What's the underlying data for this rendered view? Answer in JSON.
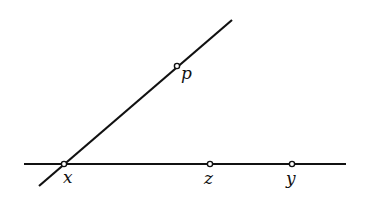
{
  "diagram": {
    "lines": [
      {
        "id": "horizontal-line",
        "x1": 24,
        "y1": 164,
        "x2": 346,
        "y2": 164
      },
      {
        "id": "slanted-line",
        "x1": 39,
        "y1": 186,
        "x2": 232,
        "y2": 20
      }
    ],
    "points": [
      {
        "id": "x",
        "label": "x",
        "cx": 64,
        "cy": 164,
        "lx": 63,
        "ly": 183
      },
      {
        "id": "p",
        "label": "p",
        "cx": 177,
        "cy": 66,
        "lx": 181,
        "ly": 79
      },
      {
        "id": "z",
        "label": "z",
        "cx": 210,
        "cy": 164,
        "lx": 204,
        "ly": 184
      },
      {
        "id": "y",
        "label": "y",
        "cx": 292,
        "cy": 164,
        "lx": 286,
        "ly": 184
      }
    ],
    "colors": {
      "stroke": "#111111",
      "background": "#ffffff"
    }
  }
}
